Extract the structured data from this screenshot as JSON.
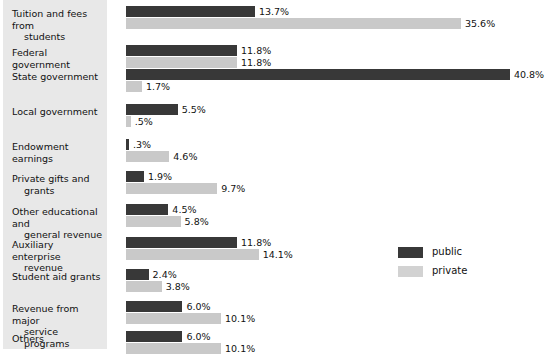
{
  "chart_data": {
    "type": "bar",
    "title": "",
    "subtitle": "",
    "xlabel": "",
    "ylabel": "",
    "orientation": "horizontal",
    "grid": false,
    "value_suffix": "%",
    "xlim": [
      0,
      40.8
    ],
    "legend_position": "center-right",
    "categories": [
      "Tuition and fees from students",
      "Federal government",
      "State government",
      "Local government",
      "Endowment earnings",
      "Private gifts and grants",
      "Other educational and general revenue",
      "Auxiliary enterprise revenue",
      "Student aid grants",
      "Revenue from major service programs",
      "Others"
    ],
    "series": [
      {
        "name": "public",
        "color": "#383838",
        "values": [
          13.7,
          11.8,
          40.8,
          5.5,
          0.3,
          1.9,
          4.5,
          11.8,
          2.4,
          6.0,
          6.0
        ],
        "labels": [
          "13.7%",
          "11.8%",
          "40.8%",
          "5.5%",
          ".3%",
          "1.9%",
          "4.5%",
          "11.8%",
          "2.4%",
          "6.0%",
          "6.0%"
        ]
      },
      {
        "name": "private",
        "color": "#c9c9c9",
        "values": [
          35.6,
          11.8,
          1.7,
          0.5,
          4.6,
          9.7,
          5.8,
          14.1,
          3.8,
          10.1,
          10.1
        ],
        "labels": [
          "35.6%",
          "11.8%",
          "1.7%",
          ".5%",
          "4.6%",
          "9.7%",
          "5.8%",
          "14.1%",
          "3.8%",
          "10.1%",
          "10.1%"
        ]
      }
    ]
  },
  "labels": {
    "rows": [
      {
        "line1": "Tuition and fees from",
        "line2": "students"
      },
      {
        "line1": "Federal government",
        "line2": ""
      },
      {
        "line1": "State government",
        "line2": ""
      },
      {
        "line1": "Local government",
        "line2": ""
      },
      {
        "line1": "Endowment earnings",
        "line2": ""
      },
      {
        "line1": "Private gifts and",
        "line2": "grants"
      },
      {
        "line1": "Other educational and",
        "line2": "general revenue"
      },
      {
        "line1": "Auxiliary enterprise",
        "line2": "revenue"
      },
      {
        "line1": "Student aid grants",
        "line2": ""
      },
      {
        "line1": "Revenue from major",
        "line2": "service programs"
      },
      {
        "line1": "Others",
        "line2": ""
      }
    ]
  },
  "legend": {
    "items": [
      {
        "label": "public",
        "color": "#383838"
      },
      {
        "label": "private",
        "color": "#d2d2d2"
      }
    ]
  }
}
